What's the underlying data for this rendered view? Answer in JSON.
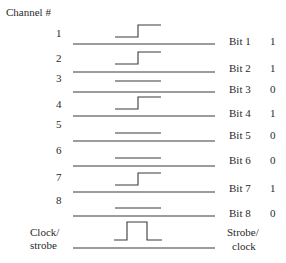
{
  "diagram": {
    "channel_header": "Channel #",
    "channels": [
      {
        "number": "1",
        "bit_label": "Bit 1",
        "value": "1"
      },
      {
        "number": "2",
        "bit_label": "Bit 2",
        "value": "1"
      },
      {
        "number": "3",
        "bit_label": "Bit 3",
        "value": "0"
      },
      {
        "number": "4",
        "bit_label": "Bit 4",
        "value": "1"
      },
      {
        "number": "5",
        "bit_label": "Bit 5",
        "value": "0"
      },
      {
        "number": "6",
        "bit_label": "Bit 6",
        "value": "0"
      },
      {
        "number": "7",
        "bit_label": "Bit 7",
        "value": "1"
      },
      {
        "number": "8",
        "bit_label": "Bit 8",
        "value": "0"
      }
    ],
    "clock": {
      "left_label_line1": "Clock/",
      "left_label_line2": "strobe",
      "right_label_line1": "Strobe/",
      "right_label_line2": "clock",
      "waveform": "pulse"
    }
  }
}
